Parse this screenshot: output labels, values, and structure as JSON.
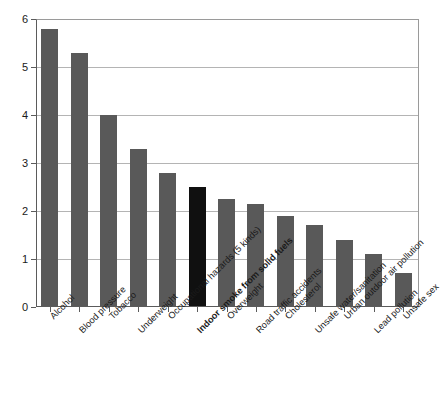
{
  "chart_data": {
    "type": "bar",
    "title": "",
    "subtitle": "",
    "xlabel": "",
    "ylabel": "",
    "ylim": [
      0,
      6
    ],
    "yticks": [
      0,
      1,
      2,
      3,
      4,
      5,
      6
    ],
    "ytick_labels": [
      "0",
      "1",
      "2",
      "3",
      "4",
      "5",
      "6"
    ],
    "grid": true,
    "legend": false,
    "legend_position": "none",
    "orientation": "vertical",
    "categories": [
      "Alcohol",
      "Blood pressure",
      "Tobacco",
      "Underweight",
      "Occupational hazards (5 kinds)",
      "Indoor smoke from solid fuels",
      "Overweight",
      "Road traffic accidents",
      "Cholesterol",
      "Unsafe water/sanitation",
      "Urban outdoor air pollution",
      "Lead pollution",
      "Unsafe sex"
    ],
    "values": [
      5.8,
      5.3,
      4.0,
      3.3,
      2.8,
      2.5,
      2.25,
      2.15,
      1.9,
      1.7,
      1.4,
      1.1,
      0.7
    ],
    "highlight_index": 5,
    "colors": {
      "bar": "#595959",
      "bar_highlight": "#101010",
      "grid": "#b4b4b4",
      "axis": "#5b5b5b",
      "text": "#1a1a1a",
      "background": "#ffffff"
    }
  }
}
